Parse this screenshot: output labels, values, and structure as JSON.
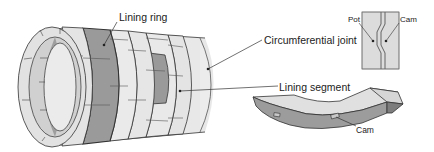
{
  "diagram": {
    "labels": {
      "lining_ring": "Lining ring",
      "circumferential_joint": "Circumferential joint",
      "lining_segment": "Lining segment",
      "pot": "Pot",
      "cam_detail": "Cam",
      "cam_segment": "Cam"
    },
    "colors": {
      "light_segment": "#e6e6e6",
      "dark_segment": "#9a9a9a",
      "outline": "#333333",
      "leader": "#333333",
      "segment_side": "#8f8f8f",
      "segment_top": "#dcdcdc"
    }
  }
}
